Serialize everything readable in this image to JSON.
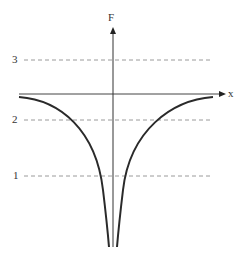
{
  "figure": {
    "y_axis_label": "F",
    "x_axis_label": "x",
    "levels": [
      {
        "label": "3",
        "y": 60
      },
      {
        "label": "2",
        "y": 120
      },
      {
        "label": "1",
        "y": 176
      }
    ],
    "colors": {
      "axis": "#222222",
      "curve": "#2a2a2a",
      "dashed": "#999999",
      "text": "#333333"
    }
  }
}
